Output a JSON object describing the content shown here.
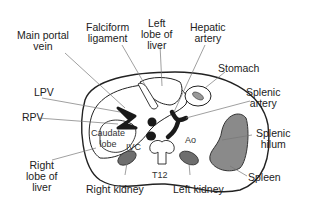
{
  "diagram": {
    "type": "anatomical cross-section",
    "labels": {
      "main_portal_vein": "Main portal\nvein",
      "falciform_ligament": "Falciform\nligament",
      "left_lobe_of_liver": "Left\nlobe of\nliver",
      "hepatic_artery": "Hepatic\nartery",
      "stomach": "Stomach",
      "lpv": "LPV",
      "splenic_artery": "Splenic\nartery",
      "rpv": "RPV",
      "caudate_lobe": "Caudate\nlobe",
      "ivc": "IVC",
      "ao": "Ao",
      "splenic_hilum": "Splenic\nhilum",
      "right_lobe_of_liver": "Right\nlobe of\nliver",
      "t12": "T12",
      "spleen": "Spleen",
      "right_kidney": "Right kidney",
      "left_kidney": "Left kidney"
    },
    "colors": {
      "outline": "#222222",
      "vessel_fill": "#1a1a1a",
      "organ_gray": "#8a8a8a",
      "background": "#ffffff",
      "leader_line": "#777777"
    }
  }
}
